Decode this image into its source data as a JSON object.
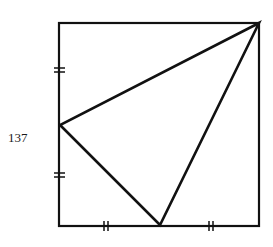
{
  "figure": {
    "label": "137",
    "square": {
      "x1": 59,
      "y1": 23,
      "x2": 259,
      "y2": 226
    },
    "triangle": {
      "vertices": [
        {
          "name": "top-right",
          "x": 259,
          "y": 23
        },
        {
          "name": "left-midpoint",
          "x": 60,
          "y": 125
        },
        {
          "name": "bottom-midpoint",
          "x": 160,
          "y": 225
        }
      ]
    },
    "tick_marks": [
      {
        "side": "left-upper",
        "x": 59,
        "y": 70,
        "orientation": "horizontal"
      },
      {
        "side": "left-lower",
        "x": 59,
        "y": 175,
        "orientation": "horizontal"
      },
      {
        "side": "bottom-left",
        "x": 106,
        "y": 226,
        "orientation": "vertical"
      },
      {
        "side": "bottom-right",
        "x": 211,
        "y": 226,
        "orientation": "vertical"
      }
    ],
    "stroke_color": "#111111"
  }
}
